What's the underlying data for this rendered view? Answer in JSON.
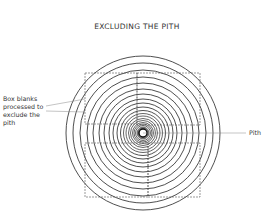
{
  "diagram": {
    "title": "EXCLUDING THE PITH",
    "labels": {
      "box_blanks": "Box blanks processed to exclude the pith",
      "pith": "Pith"
    },
    "center": [
      143,
      133
    ],
    "ring_radii": [
      77,
      70,
      63,
      56,
      50,
      44,
      39,
      34,
      30,
      26,
      22.5,
      19.5,
      17,
      14.5,
      12.5,
      10.5,
      9,
      7.5
    ],
    "pith_radius": 4,
    "boxes": [
      {
        "name": "top-left-box",
        "x": 85,
        "y": 73,
        "w": 52,
        "h": 51
      },
      {
        "name": "top-right-box",
        "x": 137,
        "y": 73,
        "w": 63,
        "h": 52
      },
      {
        "name": "bottom-right-box",
        "x": 148,
        "y": 143,
        "w": 52,
        "h": 54
      },
      {
        "name": "bottom-left-box",
        "x": 85,
        "y": 143,
        "w": 63,
        "h": 54
      }
    ],
    "colors": {
      "line": "#222222",
      "dashed": "#555555",
      "leader": "#888888",
      "text": "#333333"
    }
  }
}
